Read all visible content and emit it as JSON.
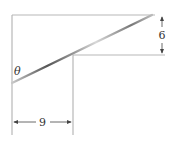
{
  "diagram": {
    "labels": {
      "angle": "θ",
      "horizontal_dimension": "9",
      "vertical_dimension": "6"
    },
    "colors": {
      "lines": "#b8b8b8",
      "rod": "#555555",
      "text": "#333333",
      "arrows": "#444444"
    }
  }
}
